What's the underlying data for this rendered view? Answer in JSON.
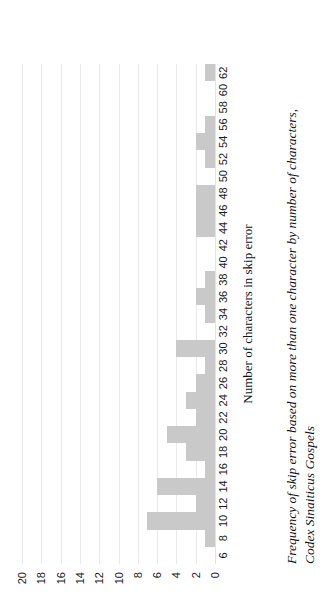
{
  "figure": {
    "caption_line1": "Frequency of skip error based on more than one character by number of characters,",
    "caption_line2": "Codex Sinaiticus Gospels"
  },
  "chart_data": {
    "type": "bar",
    "title": "",
    "xlabel": "Number of characters in skip error",
    "ylabel": "",
    "orientation": "vertical-rotated-90ccw",
    "bar_color": "#c9c9c9",
    "grid": true,
    "legend": false,
    "xlim": [
      6,
      62
    ],
    "ylim": [
      0,
      20
    ],
    "ytick_labels": [
      "20",
      "18",
      "16",
      "14",
      "12",
      "10",
      "8",
      "6",
      "4",
      "2",
      "0"
    ],
    "yticks": [
      20,
      18,
      16,
      14,
      12,
      10,
      8,
      6,
      4,
      2,
      0
    ],
    "categories": [
      "6",
      "8",
      "10",
      "12",
      "14",
      "16",
      "18",
      "20",
      "22",
      "24",
      "26",
      "28",
      "30",
      "32",
      "34",
      "36",
      "38",
      "40",
      "42",
      "44",
      "46",
      "48",
      "50",
      "52",
      "54",
      "56",
      "58",
      "60",
      "62"
    ],
    "values": [
      0,
      1,
      7,
      2,
      6,
      1,
      3,
      5,
      2,
      3,
      2,
      1,
      4,
      0,
      1,
      2,
      1,
      0,
      0,
      2,
      2,
      2,
      0,
      1,
      2,
      1,
      0,
      0,
      1
    ]
  }
}
